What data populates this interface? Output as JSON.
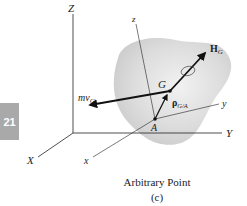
{
  "figure": {
    "chapter_tab": "21",
    "caption_title": "Arbitrary Point",
    "caption_sub": "(c)",
    "labels": {
      "Z": "Z",
      "X": "X",
      "Y": "Y",
      "z": "z",
      "x": "x",
      "y": "y",
      "G": "G",
      "A": "A",
      "mvG_main": "mv",
      "mvG_sub": "G",
      "HG_main": "H",
      "HG_sub": "G",
      "rho_main": "ρ",
      "rho_sub": "G/A"
    },
    "colors": {
      "body_fill": "#d9d9d9",
      "tab_fill": "#a9a9a9",
      "line": "#222222"
    }
  }
}
